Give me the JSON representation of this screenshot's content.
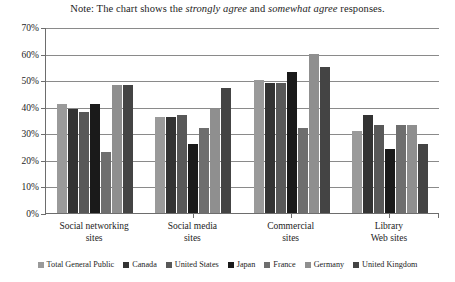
{
  "note": {
    "prefix": "Note: The chart shows the ",
    "em1": "strongly agree",
    "mid": " and ",
    "em2": "somewhat agree",
    "suffix": " responses."
  },
  "chart_data": {
    "type": "bar",
    "title": "",
    "subtitle": "",
    "xlabel": "",
    "ylabel": "",
    "ylim": [
      0,
      70
    ],
    "ytick_labels": [
      "0%",
      "10%",
      "20%",
      "30%",
      "40%",
      "50%",
      "60%",
      "70%"
    ],
    "ytick_values": [
      0,
      10,
      20,
      30,
      40,
      50,
      60,
      70
    ],
    "grid": true,
    "legend_position": "bottom",
    "categories": [
      "Social networking sites",
      "Social media sites",
      "Commercial sites",
      "Library Web sites"
    ],
    "category_lines": [
      [
        "Social networking",
        "sites"
      ],
      [
        "Social media",
        "sites"
      ],
      [
        "Commercial",
        "sites"
      ],
      [
        "Library",
        "Web sites"
      ]
    ],
    "series": [
      {
        "name": "Total General Public",
        "color": "#9a9a9a",
        "values": [
          41,
          36,
          50,
          31
        ]
      },
      {
        "name": "Canada",
        "color": "#333333",
        "values": [
          39,
          36,
          49,
          37
        ]
      },
      {
        "name": "United States",
        "color": "#585858",
        "values": [
          38,
          37,
          49,
          33
        ]
      },
      {
        "name": "Japan",
        "color": "#1a1a1a",
        "values": [
          41,
          26,
          53,
          24
        ]
      },
      {
        "name": "France",
        "color": "#6e6e6e",
        "values": [
          23,
          32,
          32,
          33
        ]
      },
      {
        "name": "Germany",
        "color": "#8f8f8f",
        "values": [
          48,
          39,
          60,
          33
        ]
      },
      {
        "name": "United Kingdom",
        "color": "#444444",
        "values": [
          48,
          47,
          55,
          26
        ]
      }
    ]
  }
}
